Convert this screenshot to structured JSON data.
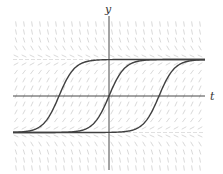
{
  "figure": {
    "type": "direction-field",
    "axes": {
      "x_label": "t",
      "y_label": "y"
    },
    "equilibria": [
      {
        "name": "upper",
        "y_value": 1,
        "style": "dashed-light"
      },
      {
        "name": "lower",
        "y_value": -1,
        "style": "dashed-light"
      }
    ],
    "solution_curves": [
      {
        "name": "left",
        "center_t": -2
      },
      {
        "name": "middle",
        "center_t": 0
      },
      {
        "name": "right",
        "center_t": 2
      }
    ],
    "colors": {
      "axis": "#333333",
      "curve": "#404040",
      "field": "#cfcfcf",
      "equilibrium": "#d8d8d8"
    }
  }
}
